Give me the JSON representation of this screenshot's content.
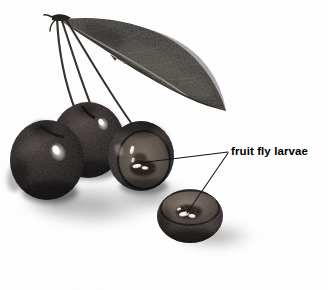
{
  "figure": {
    "kind": "photographic-illustration",
    "background_color": "#ffffff"
  },
  "annotation": {
    "label_text": "fruit fly larvae",
    "text_color": "#000000",
    "leader_line_color": "#111111",
    "leader_lines": [
      {
        "name": "leader-to-cut-cherry",
        "from_x": 228,
        "from_y": 152,
        "to_x": 139,
        "to_y": 163
      },
      {
        "name": "leader-to-cherry-half",
        "from_x": 228,
        "from_y": 153,
        "to_x": 187,
        "to_y": 213
      }
    ]
  },
  "specimen": {
    "leaf": {
      "name": "cherry-leaf",
      "fill_color": "#3a3733",
      "midrib_color": "#8d8madd",
      "tip_x": 226,
      "tip_y": 111,
      "base_x": 60,
      "base_y": 20
    },
    "stems": {
      "name": "cherry-stems",
      "count": 3,
      "color": "#2a2724",
      "junction_x": 57,
      "junction_y": 17
    },
    "cherries": [
      {
        "name": "whole-cherry-left",
        "cx": 47,
        "cy": 160,
        "rx": 37,
        "ry": 40,
        "body_color": "#1c1a19",
        "state": "whole"
      },
      {
        "name": "whole-cherry-back",
        "cx": 88,
        "cy": 140,
        "rx": 36,
        "ry": 38,
        "body_color": "#1f1d1b",
        "state": "whole"
      },
      {
        "name": "cut-cherry-right",
        "cx": 141,
        "cy": 156,
        "rx": 33,
        "ry": 35,
        "body_color": "#262320",
        "state": "cut-open",
        "larvae_visible": true
      },
      {
        "name": "cherry-half-front",
        "cx": 190,
        "cy": 216,
        "rx": 33,
        "ry": 27,
        "body_color": "#2b2724",
        "state": "halved",
        "larvae_visible": true
      }
    ],
    "shadow": {
      "name": "drop-shadow",
      "color": "#b9b9b9"
    }
  }
}
